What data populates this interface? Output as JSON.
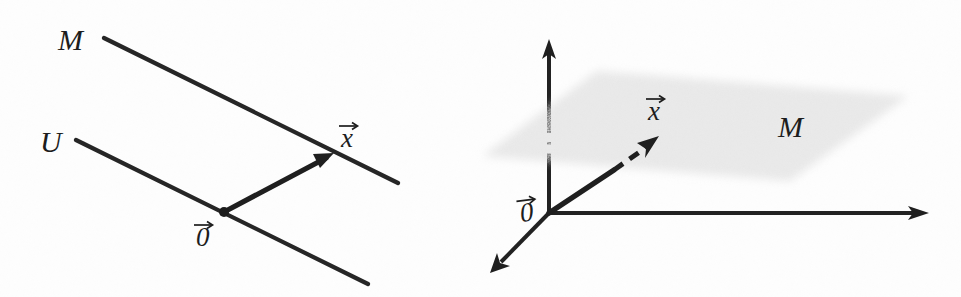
{
  "figure": {
    "background_color": "#fdfdfd",
    "ink_color": "#1f1f1f",
    "plane_color": "#d9d9d9",
    "width": 961,
    "height": 297
  },
  "left_panel": {
    "name": "two-parallel-lines-diagram",
    "caption": "Affine line M parallel to linear line U through the origin",
    "labels": {
      "affine_set": "M",
      "subspace": "U",
      "point_vector": "x",
      "origin_vector": "0"
    },
    "affine_line": {
      "label": "M",
      "x1": 104,
      "y1": 38,
      "x2": 398,
      "y2": 183
    },
    "subspace_line": {
      "label": "U",
      "x1": 76,
      "y1": 140,
      "x2": 368,
      "y2": 284
    },
    "vector": {
      "label": "x",
      "from_x": 224,
      "from_y": 212,
      "to_x": 330,
      "to_y": 156
    },
    "origin": {
      "label": "0",
      "x": 224,
      "y": 212
    },
    "label_positions": {
      "M": {
        "x": 58,
        "y": 50
      },
      "U": {
        "x": 40,
        "y": 152
      },
      "x": {
        "x": 341,
        "y": 147
      },
      "0": {
        "x": 196,
        "y": 246
      }
    }
  },
  "right_panel": {
    "name": "three-dimensional-plane-diagram",
    "caption": "Linear plane M through the origin in three-space with vector x",
    "labels": {
      "plane": "M",
      "point_vector": "x",
      "origin_vector": "0"
    },
    "origin": {
      "label": "0",
      "x": 549,
      "y": 213
    },
    "axes": [
      {
        "name": "vertical-axis",
        "from_x": 549,
        "from_y": 213,
        "to_x": 549,
        "to_y": 41,
        "hidden_from_y": 131,
        "hidden_to_y": 155
      },
      {
        "name": "horizontal-axis",
        "from_x": 549,
        "from_y": 213,
        "to_x": 928,
        "to_y": 213
      },
      {
        "name": "depth-axis",
        "from_x": 549,
        "from_y": 213,
        "to_x": 492,
        "to_y": 271
      }
    ],
    "plane": {
      "label": "M",
      "corners": [
        [
          597,
          71
        ],
        [
          908,
          96
        ],
        [
          790,
          181
        ],
        [
          483,
          156
        ]
      ]
    },
    "vector": {
      "label": "x",
      "from_x": 549,
      "from_y": 213,
      "break_x": 615,
      "break_y": 170,
      "to_x": 656,
      "to_y": 139
    },
    "label_positions": {
      "M": {
        "x": 778,
        "y": 137
      },
      "x": {
        "x": 648,
        "y": 120
      },
      "0": {
        "x": 521,
        "y": 222
      }
    }
  }
}
